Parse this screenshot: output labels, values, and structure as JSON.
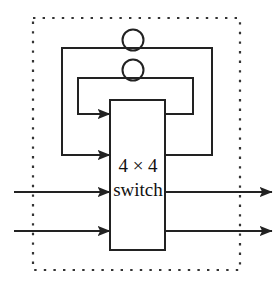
{
  "figure": {
    "name": "4x4-switch-with-feedback-loops",
    "background_color": "#ffffff",
    "line_color": "#222222",
    "text_color": "#111111",
    "dashed_border_color": "#333333"
  },
  "switch_block": {
    "label_line_1": "4 × 4",
    "label_line_2": "switch",
    "x": 110,
    "y": 100,
    "width": 55,
    "height": 150,
    "stroke_width": 2
  },
  "boundary": {
    "name": "dotted-module-boundary",
    "x": 33,
    "y": 18,
    "width": 207,
    "height": 252,
    "style": "dotted"
  },
  "delay_elements": [
    {
      "name": "delay-circle-outer",
      "cx": 133,
      "cy": 40,
      "r": 10
    },
    {
      "name": "delay-circle-inner",
      "cx": 133,
      "cy": 70,
      "r": 10
    }
  ],
  "feedback_loops": [
    {
      "name": "outer-feedback-loop",
      "from_box_y": 155,
      "top_y": 48,
      "left_x": 62,
      "right_x": 212,
      "arrow_into_box_y": 155
    },
    {
      "name": "inner-feedback-loop",
      "from_box_y": 114,
      "top_y": 78,
      "left_x": 78,
      "right_x": 193,
      "arrow_into_box_y": 114
    }
  ],
  "inputs": [
    {
      "name": "input-line-1",
      "y": 192,
      "start_x": 14,
      "end_x": 110
    },
    {
      "name": "input-line-2",
      "y": 231,
      "start_x": 14,
      "end_x": 110
    }
  ],
  "outputs": [
    {
      "name": "output-line-1",
      "y": 192,
      "start_x": 165,
      "end_x": 272
    },
    {
      "name": "output-line-2",
      "y": 231,
      "start_x": 165,
      "end_x": 272
    }
  ],
  "counts": {
    "inputs": 2,
    "outputs": 2,
    "feedback_loops": 2,
    "delay_circles": 2
  }
}
